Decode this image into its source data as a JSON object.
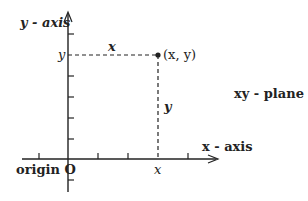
{
  "diagram": {
    "y_axis_label": "y - axis",
    "x_axis_label": "x - axis",
    "plane_label": "xy - plane",
    "origin_label": "origin O",
    "point_label": "(x, y)",
    "x_coord_label": "x",
    "y_coord_label": "y",
    "horizontal_distance_label": "x",
    "vertical_distance_label": "y",
    "colors": {
      "ink": "#222222",
      "background": "#ffffff"
    }
  }
}
